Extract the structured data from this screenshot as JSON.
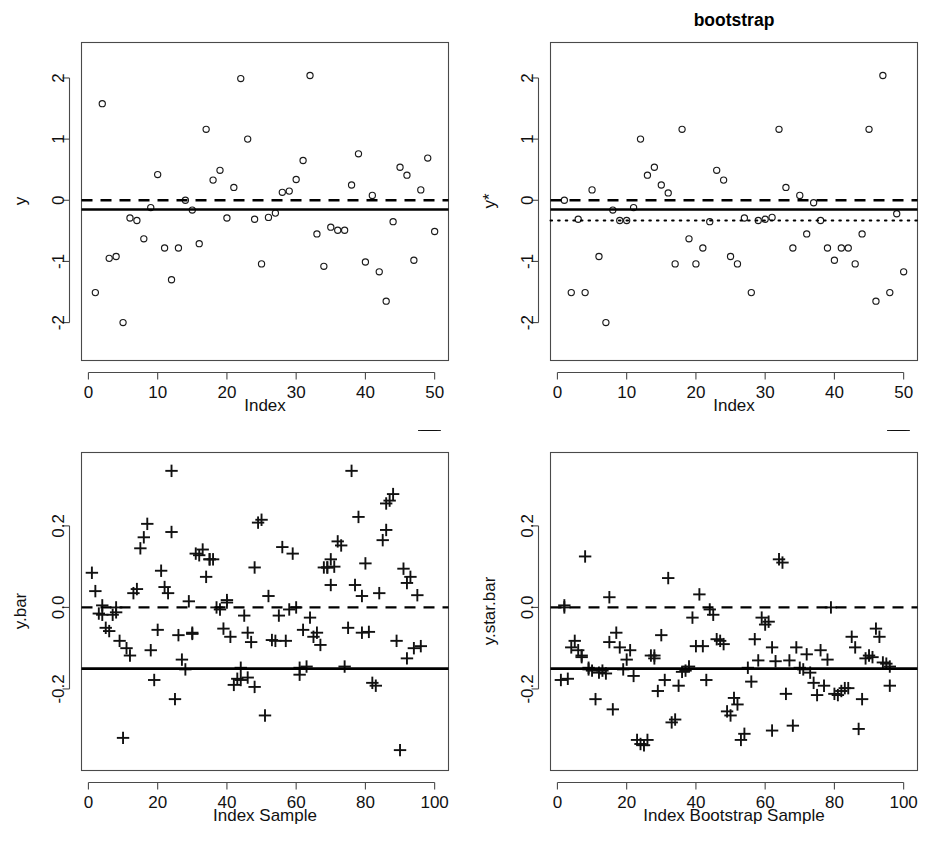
{
  "figure": {
    "title": "bootstrap",
    "background": "#ffffff",
    "foreground": "#000000",
    "layout": "2x2 panel grid"
  },
  "chart_data": [
    {
      "id": "panel-top-left",
      "type": "scatter",
      "title": "",
      "xlabel": "Index",
      "ylabel": "y",
      "xlim": [
        -1,
        52
      ],
      "ylim": [
        -2.62,
        2.58
      ],
      "xticks": [
        0,
        10,
        20,
        30,
        40,
        50
      ],
      "yticks": [
        -2,
        -1,
        0,
        1,
        2
      ],
      "xticklabels": [
        "0",
        "10",
        "20",
        "30",
        "40",
        "50"
      ],
      "yticklabels": [
        "-2",
        "-1",
        "0",
        "1",
        "2"
      ],
      "grid": false,
      "legend": "none",
      "marker": "open-circle",
      "x": [
        1,
        2,
        3,
        4,
        5,
        6,
        7,
        8,
        9,
        10,
        11,
        12,
        13,
        14,
        15,
        16,
        17,
        18,
        19,
        20,
        21,
        22,
        23,
        24,
        25,
        26,
        27,
        28,
        29,
        30,
        31,
        32,
        33,
        34,
        35,
        36,
        37,
        38,
        39,
        40,
        41,
        42,
        43,
        44,
        45,
        46,
        47,
        48,
        49,
        50
      ],
      "y": [
        -1.51,
        1.58,
        -0.95,
        -0.92,
        -2.0,
        -0.29,
        -0.33,
        -0.63,
        -0.12,
        0.42,
        -0.78,
        -1.3,
        -0.78,
        0.0,
        -0.16,
        -0.71,
        1.16,
        0.33,
        0.49,
        -0.29,
        0.21,
        1.99,
        1.0,
        -0.31,
        -1.04,
        -0.28,
        -0.21,
        0.13,
        0.15,
        0.34,
        0.65,
        2.04,
        -0.55,
        -1.08,
        -0.44,
        -0.49,
        -0.49,
        0.25,
        0.76,
        -1.01,
        0.08,
        -1.17,
        -1.65,
        -0.35,
        0.54,
        0.41,
        -0.98,
        0.17,
        0.69,
        -0.51
      ],
      "reference_lines": [
        {
          "name": "zero-line",
          "style": "dashed",
          "y": 0.0
        },
        {
          "name": "sample-mean-line",
          "style": "solid",
          "y": -0.15
        }
      ]
    },
    {
      "id": "panel-top-right",
      "type": "scatter",
      "title": "bootstrap",
      "xlabel": "Index",
      "ylabel": "y*",
      "xlim": [
        -1,
        52
      ],
      "ylim": [
        -2.62,
        2.58
      ],
      "xticks": [
        0,
        10,
        20,
        30,
        40,
        50
      ],
      "yticks": [
        -2,
        -1,
        0,
        1,
        2
      ],
      "xticklabels": [
        "0",
        "10",
        "20",
        "30",
        "40",
        "50"
      ],
      "yticklabels": [
        "-2",
        "-1",
        "0",
        "1",
        "2"
      ],
      "grid": false,
      "legend": "none",
      "marker": "open-circle",
      "x": [
        1,
        2,
        3,
        4,
        5,
        6,
        7,
        8,
        9,
        10,
        11,
        12,
        13,
        14,
        15,
        16,
        17,
        18,
        19,
        20,
        21,
        22,
        23,
        24,
        25,
        26,
        27,
        28,
        29,
        30,
        31,
        32,
        33,
        34,
        35,
        36,
        37,
        38,
        39,
        40,
        41,
        42,
        43,
        44,
        45,
        46,
        47,
        48,
        49,
        50
      ],
      "y": [
        0.0,
        -1.51,
        -0.31,
        -1.51,
        0.17,
        -0.92,
        -2.0,
        -0.16,
        -0.33,
        -0.33,
        -0.12,
        1.0,
        0.41,
        0.54,
        0.25,
        0.12,
        -1.04,
        1.16,
        -0.63,
        -1.04,
        -0.78,
        -0.35,
        0.49,
        0.33,
        -0.92,
        -1.04,
        -0.29,
        -1.51,
        -0.33,
        -0.31,
        -0.28,
        1.16,
        0.21,
        -0.78,
        0.08,
        -0.55,
        -0.04,
        -0.33,
        -0.78,
        -0.98,
        -0.78,
        -0.78,
        -1.04,
        -0.55,
        1.16,
        -1.65,
        2.04,
        -1.51,
        -0.22,
        -1.17
      ],
      "reference_lines": [
        {
          "name": "zero-line",
          "style": "dashed",
          "y": 0.0
        },
        {
          "name": "sample-mean-line",
          "style": "solid",
          "y": -0.15
        },
        {
          "name": "bootstrap-mean-line",
          "style": "dotted",
          "y": -0.33
        }
      ]
    },
    {
      "id": "panel-bottom-left",
      "type": "scatter",
      "title": "",
      "xlabel": "Index Sample",
      "ylabel": "y.bar",
      "xlim": [
        -2,
        104
      ],
      "ylim": [
        -0.4,
        0.38
      ],
      "xticks": [
        0,
        20,
        40,
        60,
        80,
        100
      ],
      "yticks": [
        -0.2,
        0.0,
        0.2
      ],
      "xticklabels": [
        "0",
        "20",
        "40",
        "60",
        "80",
        "100"
      ],
      "yticklabels": [
        "-0.2",
        "0.0",
        "0.2"
      ],
      "grid": false,
      "legend": "none",
      "marker": "plus",
      "x": [
        1,
        2,
        3,
        4,
        4,
        5,
        6,
        7,
        8,
        8,
        9,
        10,
        11,
        12,
        13,
        14,
        15,
        16,
        17,
        18,
        19,
        20,
        21,
        22,
        23,
        24,
        24,
        25,
        26,
        27,
        28,
        29,
        30,
        30,
        31,
        32,
        33,
        34,
        35,
        35,
        36,
        37,
        38,
        39,
        40,
        40,
        41,
        42,
        43,
        44,
        44,
        45,
        46,
        46,
        47,
        48,
        48,
        49,
        50,
        51,
        52,
        53,
        54,
        55,
        56,
        57,
        58,
        59,
        60,
        61,
        61,
        62,
        63,
        64,
        65,
        66,
        67,
        68,
        69,
        69,
        70,
        70,
        71,
        72,
        73,
        74,
        75,
        76,
        77,
        78,
        79,
        79,
        80,
        81,
        82,
        83,
        84,
        85,
        86,
        86,
        87,
        88,
        89,
        90,
        91,
        92,
        92,
        93,
        94,
        95,
        96,
        97,
        98,
        98,
        99,
        100
      ],
      "y": [
        0.085,
        0.04,
        -0.015,
        -0.018,
        0.005,
        -0.05,
        -0.058,
        -0.018,
        0.0,
        -0.012,
        -0.082,
        -0.32,
        -0.1,
        -0.118,
        0.035,
        0.045,
        0.145,
        0.172,
        0.205,
        -0.105,
        -0.178,
        -0.055,
        0.09,
        0.05,
        0.035,
        0.185,
        0.335,
        -0.225,
        -0.068,
        -0.128,
        -0.152,
        0.015,
        -0.065,
        -0.062,
        0.132,
        0.128,
        0.142,
        0.075,
        0.118,
        0.118,
        0.118,
        0.0,
        -0.005,
        -0.052,
        0.012,
        0.018,
        -0.072,
        -0.19,
        -0.175,
        -0.148,
        -0.178,
        -0.02,
        -0.172,
        -0.062,
        -0.085,
        -0.195,
        0.098,
        0.208,
        0.215,
        -0.265,
        0.028,
        -0.08,
        -0.082,
        -0.02,
        0.148,
        -0.082,
        -0.005,
        0.132,
        0.0,
        -0.148,
        -0.165,
        -0.055,
        -0.145,
        -0.025,
        -0.072,
        -0.062,
        -0.092,
        0.098,
        0.098,
        0.098,
        0.055,
        0.118,
        0.1,
        0.162,
        0.152,
        -0.145,
        -0.05,
        0.335,
        0.055,
        0.222,
        -0.062,
        0.028,
        0.108,
        -0.06,
        -0.185,
        -0.192,
        0.035,
        0.165,
        0.19,
        0.255,
        0.262,
        0.278,
        -0.082,
        -0.35,
        0.095,
        -0.125,
        0.06,
        0.075,
        -0.1,
        0.03,
        -0.095
      ],
      "reference_lines": [
        {
          "name": "zero-line",
          "style": "dashed",
          "y": 0.0
        },
        {
          "name": "overall-mean-line",
          "style": "solid",
          "y": -0.15
        }
      ]
    },
    {
      "id": "panel-bottom-right",
      "type": "scatter",
      "title": "",
      "xlabel": "Index Bootstrap Sample",
      "ylabel": "y.star.bar",
      "xlim": [
        -2,
        104
      ],
      "ylim": [
        -0.4,
        0.38
      ],
      "xticks": [
        0,
        20,
        40,
        60,
        80,
        100
      ],
      "yticks": [
        -0.2,
        0.0,
        0.2
      ],
      "xticklabels": [
        "0",
        "20",
        "40",
        "60",
        "80",
        "100"
      ],
      "yticklabels": [
        "-0.2",
        "0.0",
        "0.2"
      ],
      "grid": false,
      "legend": "none",
      "marker": "plus",
      "x": [
        1,
        2,
        2,
        3,
        4,
        5,
        6,
        7,
        7,
        8,
        9,
        9,
        10,
        11,
        12,
        13,
        14,
        15,
        15,
        16,
        17,
        18,
        19,
        20,
        21,
        22,
        23,
        24,
        25,
        26,
        27,
        28,
        28,
        29,
        30,
        31,
        32,
        33,
        34,
        35,
        36,
        37,
        38,
        39,
        40,
        41,
        42,
        43,
        44,
        45,
        46,
        47,
        48,
        49,
        50,
        51,
        52,
        53,
        54,
        55,
        56,
        57,
        58,
        59,
        60,
        61,
        62,
        62,
        63,
        64,
        65,
        66,
        67,
        68,
        69,
        70,
        71,
        72,
        73,
        74,
        75,
        76,
        77,
        78,
        79,
        80,
        81,
        82,
        83,
        84,
        85,
        86,
        87,
        88,
        89,
        90,
        91,
        92,
        93,
        94,
        95,
        96,
        96,
        97,
        98,
        99,
        100
      ],
      "y": [
        -0.178,
        0.005,
        0.0,
        -0.175,
        -0.098,
        -0.082,
        -0.105,
        -0.118,
        -0.122,
        0.125,
        -0.148,
        -0.152,
        -0.155,
        -0.225,
        -0.16,
        -0.155,
        -0.162,
        0.025,
        -0.085,
        -0.25,
        -0.062,
        -0.098,
        -0.152,
        -0.128,
        -0.105,
        -0.168,
        -0.325,
        -0.335,
        -0.338,
        -0.325,
        -0.118,
        -0.118,
        -0.125,
        -0.205,
        -0.068,
        -0.178,
        0.072,
        -0.282,
        -0.275,
        -0.192,
        -0.158,
        -0.155,
        -0.145,
        -0.025,
        -0.095,
        0.032,
        -0.095,
        -0.178,
        -0.005,
        -0.018,
        -0.078,
        -0.082,
        -0.09,
        -0.255,
        -0.265,
        -0.222,
        -0.238,
        -0.325,
        -0.31,
        -0.148,
        -0.182,
        -0.078,
        -0.13,
        -0.025,
        -0.042,
        -0.035,
        -0.098,
        -0.302,
        -0.132,
        0.118,
        0.11,
        -0.212,
        -0.13,
        -0.29,
        -0.098,
        -0.148,
        -0.152,
        -0.115,
        -0.16,
        -0.185,
        -0.215,
        -0.105,
        -0.192,
        -0.128,
        0.0,
        -0.212,
        -0.215,
        -0.205,
        -0.198,
        -0.198,
        -0.072,
        -0.098,
        -0.298,
        -0.225,
        -0.125,
        -0.118,
        -0.122,
        -0.052,
        -0.072,
        -0.135,
        -0.138,
        -0.145,
        -0.192
      ],
      "reference_lines": [
        {
          "name": "zero-line",
          "style": "dashed",
          "y": 0.0
        },
        {
          "name": "overall-mean-line",
          "style": "solid",
          "y": -0.15
        }
      ]
    }
  ]
}
